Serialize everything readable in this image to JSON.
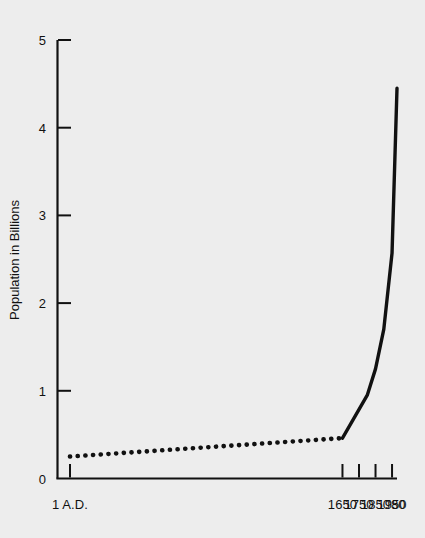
{
  "chart_data": {
    "type": "line",
    "title": "",
    "xlabel": "",
    "ylabel": "Population in Billions",
    "background_color": "#ededed",
    "line_color": "#111111",
    "grid": false,
    "legend": null,
    "xlim": [
      1,
      1980
    ],
    "ylim": [
      0,
      5
    ],
    "y_ticks": [
      "0",
      "1",
      "2",
      "3",
      "4",
      "5"
    ],
    "y_tick_values": [
      0,
      1,
      2,
      3,
      4,
      5
    ],
    "x_ticks": [
      "1 A.D.",
      "1650",
      "1750",
      "1850",
      "1950",
      "'80"
    ],
    "x_tick_values": [
      1,
      1650,
      1750,
      1850,
      1950,
      1980
    ],
    "series": [
      {
        "name": "Estimated population (dotted)",
        "style": "dotted",
        "x": [
          1,
          235,
          470,
          705,
          940,
          1175,
          1410,
          1650
        ],
        "values": [
          0.25,
          0.28,
          0.31,
          0.34,
          0.37,
          0.4,
          0.43,
          0.46
        ]
      },
      {
        "name": "World population (solid)",
        "style": "solid",
        "x": [
          1650,
          1800,
          1850,
          1900,
          1950,
          1980
        ],
        "values": [
          0.46,
          0.95,
          1.25,
          1.7,
          2.57,
          4.45
        ]
      }
    ]
  }
}
